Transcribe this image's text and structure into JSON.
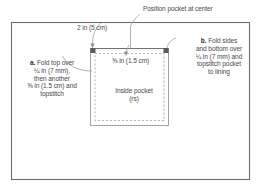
{
  "diagram": {
    "type": "sewing-pattern",
    "colors": {
      "frame_border": "#6e6e6e",
      "pocket_outline": "#8a8a8a",
      "stitch_dashed": "#9a9a9a",
      "leader_line": "#9a9a9a",
      "corner_mark": "#3a3a3a",
      "text": "#4a4a4a",
      "background": "#ffffff"
    },
    "frame": {
      "x": 11,
      "y": 22,
      "width": 239,
      "height": 158
    },
    "pocket": {
      "x": 90,
      "y": 48,
      "width": 79,
      "height": 78,
      "stitch_inset": 5
    }
  },
  "captions": {
    "position_pocket": "Position pocket at center",
    "two_in": "2 in (5 cm)",
    "five_eighths_in": "⅝ in (1.5 cm)",
    "inside_pocket": "Inside pocket\n(rs)"
  },
  "notes": {
    "a": {
      "tag": "a.",
      "text": " Fold top over\n¼ in (7 mm),\nthen another\n⅝ in (1.5 cm) and\ntopstitch"
    },
    "b": {
      "tag": "b.",
      "text": " Fold sides\nand bottom over\n¼ in (7 mm) and\ntopstitch pocket\nto lining"
    }
  },
  "measurements": {
    "top_fold_first": "¼ in (7 mm)",
    "top_fold_second": "⅝ in (1.5 cm)",
    "side_bottom_fold": "¼ in (7 mm)",
    "center_offset": "2 in (5 cm)",
    "stitch_allowance": "⅝ in (1.5 cm)"
  }
}
